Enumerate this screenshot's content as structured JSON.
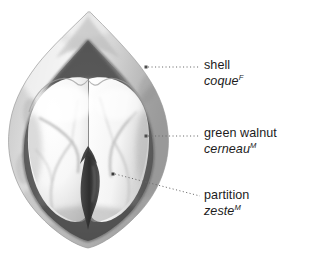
{
  "figure": {
    "style": "grayscale pencil illustration",
    "background_color": "#ffffff",
    "palette": {
      "shell_outer": "#d6d6d6",
      "shell_mid": "#b3b3b3",
      "shell_inner_dark": "#5e5e5e",
      "cavity_dark": "#6f6f6f",
      "kernel_light": "#fbfbfb",
      "kernel_shadow": "#c9c9c9",
      "partition_dark": "#3d3d3d",
      "leader_line": "#6b6b6b",
      "text": "#1c1c1c"
    }
  },
  "labels": [
    {
      "id": "shell",
      "en": "shell",
      "fr": "coque",
      "gender": "F",
      "leader": {
        "dot_x": 146,
        "dot_y": 67,
        "end_x": 200,
        "end_y": 67
      }
    },
    {
      "id": "kernel",
      "en": "green walnut",
      "fr": "cerneau",
      "gender": "M",
      "leader": {
        "dot_x": 146,
        "dot_y": 136,
        "end_x": 200,
        "end_y": 136
      }
    },
    {
      "id": "partition",
      "en": "partition",
      "fr": "zeste",
      "gender": "M",
      "leader": {
        "dot_x": 113,
        "dot_y": 174,
        "end_x": 200,
        "end_y": 196
      }
    }
  ]
}
